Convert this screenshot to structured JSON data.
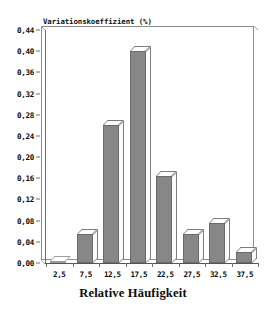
{
  "chart_data": {
    "type": "bar",
    "title": "",
    "subtitle": "",
    "xlabel": "Relative Häufigkeit",
    "ylabel": "Variationskoeffizient (%)",
    "categories": [
      "2,5",
      "7,5",
      "12,5",
      "17,5",
      "22,5",
      "27,5",
      "32,5",
      "37,5"
    ],
    "values": [
      0.0,
      0.055,
      0.26,
      0.4,
      0.165,
      0.055,
      0.075,
      0.02
    ],
    "value_labels": [
      "0,00",
      "0,055",
      "0,26",
      "0,40",
      "0,165",
      "0,055",
      "0,075",
      "0,02"
    ],
    "ylim": [
      0.0,
      0.44
    ],
    "ytick_values": [
      0.0,
      0.04,
      0.08,
      0.12,
      0.16,
      0.2,
      0.24,
      0.28,
      0.32,
      0.36,
      0.4,
      0.44
    ],
    "ytick_labels": [
      "0,00",
      "0,04",
      "0,08",
      "0,12",
      "0,16",
      "0,20",
      "0,24",
      "0,28",
      "0,32",
      "0,36",
      "0,40",
      "0,44"
    ],
    "grid": false,
    "legend": false,
    "legend_position": "none",
    "style": "3d-column",
    "colors": {
      "bar_face": "#878787",
      "bar_top": "#fdfdfd",
      "bar_side": "#fcfcfc",
      "bar_outline": "#6a6a6a",
      "axis": "#555555",
      "frame": "#8e8e8e",
      "text": "#0d0d0d",
      "background": "#ffffff"
    }
  },
  "axes": {
    "y_title": "Variationskoeffizient (%)",
    "x_title": "Relative Häufigkeit"
  }
}
